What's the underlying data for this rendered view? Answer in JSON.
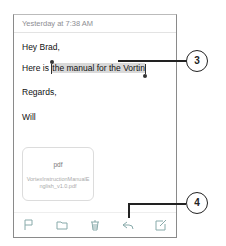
{
  "message": {
    "timestamp": "Yesterday at 7:38 AM",
    "greeting": "Hey Brad,",
    "body_prefix": "Here is ",
    "body_selected": "the manual for the Vortin",
    "closing": "Regards,",
    "signature": "Will"
  },
  "attachment": {
    "type": "pdf",
    "filename": "VortexInstructionManualEnglish_v1.0.pdf"
  },
  "toolbar": {
    "items": [
      "flag-icon",
      "folder-icon",
      "trash-icon",
      "reply-icon",
      "compose-icon"
    ]
  },
  "callouts": {
    "selection": "3",
    "reply": "4"
  }
}
